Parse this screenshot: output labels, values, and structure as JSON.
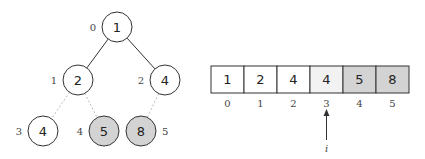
{
  "tree": {
    "nodes": [
      {
        "index": "0",
        "value": "1",
        "cx": 117,
        "cy": 27,
        "shaded": false
      },
      {
        "index": "1",
        "value": "2",
        "cx": 78,
        "cy": 80,
        "shaded": false
      },
      {
        "index": "2",
        "value": "4",
        "cx": 165,
        "cy": 80,
        "shaded": false
      },
      {
        "index": "3",
        "value": "4",
        "cx": 43,
        "cy": 131,
        "shaded": false
      },
      {
        "index": "4",
        "value": "5",
        "cx": 104,
        "cy": 131,
        "shaded": true
      },
      {
        "index": "5",
        "value": "8",
        "cx": 141,
        "cy": 131,
        "shaded": true
      }
    ],
    "edges": [
      {
        "from": 0,
        "to": 1,
        "style": "solid"
      },
      {
        "from": 0,
        "to": 2,
        "style": "solid"
      },
      {
        "from": 1,
        "to": 3,
        "style": "dotted"
      },
      {
        "from": 1,
        "to": 4,
        "style": "dotted"
      },
      {
        "from": 2,
        "to": 5,
        "style": "dotted"
      }
    ]
  },
  "array": {
    "cells": [
      {
        "value": "1",
        "index": "0",
        "shade": "none"
      },
      {
        "value": "2",
        "index": "1",
        "shade": "none"
      },
      {
        "value": "4",
        "index": "2",
        "shade": "none"
      },
      {
        "value": "4",
        "index": "3",
        "shade": "light"
      },
      {
        "value": "5",
        "index": "4",
        "shade": "dark"
      },
      {
        "value": "8",
        "index": "5",
        "shade": "dark"
      }
    ],
    "pointer": {
      "label": "i",
      "at_index": "3"
    }
  },
  "colors": {
    "stroke": "#333333",
    "shaded_fill": "#d3d3d3",
    "light_fill": "#f2f2f2",
    "dotted_edge": "#bbbbbb"
  }
}
